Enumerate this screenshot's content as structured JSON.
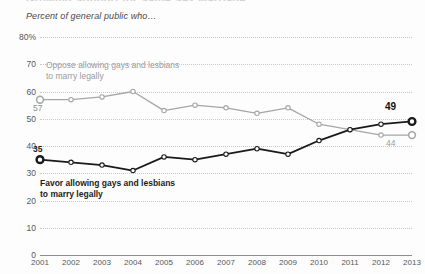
{
  "header": {
    "cut_title": "Growing Support for Same-Sex Marriage",
    "subtitle": "Percent of general public who…"
  },
  "annotations": {
    "oppose_line1": "Oppose allowing gays and lesbians",
    "oppose_line2": "to marry legally",
    "favor_line1": "Favor allowing gays and lesbians",
    "favor_line2": "to marry legally"
  },
  "endpoint_labels": {
    "oppose_start": "57",
    "favor_start": "35",
    "favor_end": "49",
    "oppose_end": "44"
  },
  "colors": {
    "favor": "#1a1a1a",
    "oppose": "#a6a6a6",
    "grid": "#c9c9c9",
    "axis": "#8e8e8e",
    "background": "#fdfdfd"
  },
  "chart_data": {
    "type": "line",
    "title": "Growing Support for Same-Sex Marriage",
    "subtitle": "Percent of general public who…",
    "xlabel": "",
    "ylabel": "",
    "ylim": [
      0,
      80
    ],
    "yticks": [
      "0",
      "10",
      "20",
      "30",
      "40",
      "50",
      "60",
      "70",
      "80%"
    ],
    "ytick_values": [
      0,
      10,
      20,
      30,
      40,
      50,
      60,
      70,
      80
    ],
    "grid": true,
    "legend": "inline-annotations",
    "categories": [
      "2001",
      "2002",
      "2003",
      "2004",
      "2005",
      "2006",
      "2007",
      "2008",
      "2009",
      "2010",
      "2011",
      "2012",
      "2013"
    ],
    "series": [
      {
        "name": "Oppose allowing gays and lesbians to marry legally",
        "color": "#a6a6a6",
        "values": [
          57,
          57,
          58,
          60,
          53,
          55,
          54,
          52,
          54,
          48,
          46,
          44,
          44
        ]
      },
      {
        "name": "Favor allowing gays and lesbians to marry legally",
        "color": "#1a1a1a",
        "values": [
          35,
          34,
          33,
          31,
          36,
          35,
          37,
          39,
          37,
          42,
          46,
          48,
          49
        ]
      }
    ]
  }
}
